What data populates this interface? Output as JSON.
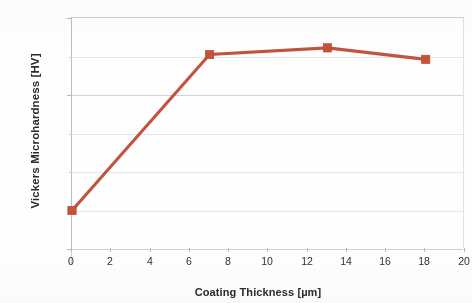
{
  "chart_data": {
    "type": "line",
    "title": "",
    "xlabel": "Coating Thickness [µm]",
    "ylabel": "Vickers Microhardness [HV]",
    "xlim": [
      0,
      20
    ],
    "ylim": [
      0,
      1200
    ],
    "xticks": [
      "0",
      "2",
      "4",
      "6",
      "8",
      "10",
      "12",
      "14",
      "16",
      "18",
      "20"
    ],
    "yticks": [
      "0",
      "200",
      "400",
      "600",
      "800",
      "1000",
      "1200"
    ],
    "x": [
      0,
      7,
      13,
      18
    ],
    "values": [
      200,
      1010,
      1045,
      985
    ],
    "series": [
      {
        "name": "Vickers Microhardness",
        "x": [
          0,
          7,
          13,
          18
        ],
        "values": [
          200,
          1010,
          1045,
          985
        ],
        "color": "#c1543f",
        "marker": "square"
      }
    ],
    "grid": true,
    "grid_axis": "y",
    "legend": false,
    "legend_position": "none",
    "line_color": "#c1543f",
    "marker_color": "#c3523d",
    "grid_color": "#c9ccd2",
    "axis_color": "#b9bcc2",
    "text_color": "#2b2b2b"
  }
}
